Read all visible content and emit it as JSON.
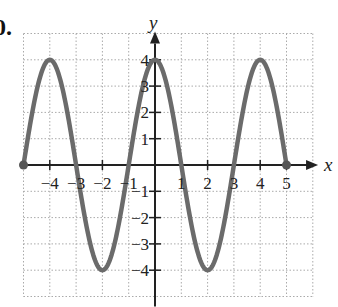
{
  "problem_label": "0.",
  "chart_data": {
    "type": "line",
    "title": "",
    "xlabel": "x",
    "ylabel": "y",
    "xlim": [
      -5,
      6
    ],
    "ylim": [
      -5,
      5
    ],
    "grid": true,
    "grid_style": "dotted",
    "x_ticks": [
      -4,
      -3,
      -2,
      -1,
      1,
      2,
      3,
      4,
      5
    ],
    "y_ticks": [
      -4,
      -3,
      -2,
      -1,
      1,
      2,
      3,
      4
    ],
    "function": "y = 4 sin(pi*(x+5)/... ) ; peaks at x=-4,0,4 (y=4), troughs at x=-2,2 (y=-4), zeros at x=-5,-3,-1,1,3,5",
    "series": [
      {
        "name": "curve",
        "color": "#6b6b6b",
        "x": [
          -5,
          -4,
          -3,
          -2,
          -1,
          0,
          1,
          2,
          3,
          4,
          5
        ],
        "y": [
          0,
          4,
          0,
          -4,
          0,
          4,
          0,
          -4,
          0,
          4,
          0
        ]
      }
    ],
    "endpoints": [
      {
        "x": -5,
        "y": 0,
        "closed": true
      },
      {
        "x": 5,
        "y": 0,
        "closed": true
      }
    ]
  }
}
